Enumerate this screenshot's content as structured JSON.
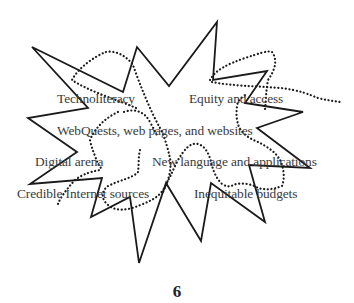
{
  "diagram": {
    "type": "starburst-concept-map",
    "labels": [
      {
        "id": "technoliteracy",
        "text": "Technoliteracy"
      },
      {
        "id": "equity-access",
        "text": "Equity and access"
      },
      {
        "id": "webquests",
        "text": "WebQuests, web pages, and websites"
      },
      {
        "id": "digital-arena",
        "text": "Digital arena"
      },
      {
        "id": "new-language",
        "text": "New language and applications"
      },
      {
        "id": "credible-sources",
        "text": "Credible Internet sources"
      },
      {
        "id": "inequitable-budgets",
        "text": "Inequitable budgets"
      }
    ],
    "colors": {
      "outline": "#1a1a1a",
      "dotted": "#1a1a1a",
      "text": "#3a3a3a",
      "background": "#ffffff"
    }
  },
  "page": {
    "number": "6"
  }
}
